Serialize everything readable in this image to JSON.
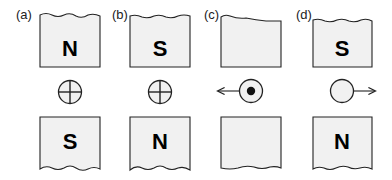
{
  "panels": [
    {
      "label": "(a)",
      "top_pole": "N",
      "bottom_pole": "S",
      "wire": "current-into-page",
      "force": "none"
    },
    {
      "label": "(b)",
      "top_pole": "S",
      "bottom_pole": "N",
      "wire": "current-into-page",
      "force": "none"
    },
    {
      "label": "(c)",
      "top_pole": "",
      "bottom_pole": "",
      "wire": "current-out-of-page",
      "force": "left"
    },
    {
      "label": "(d)",
      "top_pole": "S",
      "bottom_pole": "N",
      "wire": "unknown-current",
      "force": "right"
    }
  ],
  "colors": {
    "magnet_fill": "#f1f1f1",
    "stroke": "#222222",
    "text": "#000000"
  }
}
